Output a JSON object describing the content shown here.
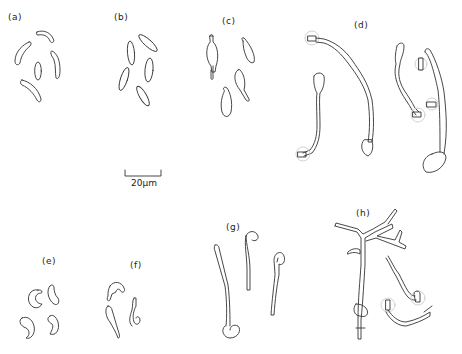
{
  "figure": {
    "panels": [
      {
        "id": "a",
        "label": "(a)"
      },
      {
        "id": "b",
        "label": "(b)"
      },
      {
        "id": "c",
        "label": "(c)"
      },
      {
        "id": "d",
        "label": "(d)"
      },
      {
        "id": "e",
        "label": "(e)"
      },
      {
        "id": "f",
        "label": "(f)"
      },
      {
        "id": "g",
        "label": "(g)"
      },
      {
        "id": "h",
        "label": "(h)"
      }
    ],
    "scale_bar": {
      "label": "20μm"
    },
    "stroke_color": "#333333",
    "halo_color": "#cccccc",
    "background": "#ffffff"
  }
}
